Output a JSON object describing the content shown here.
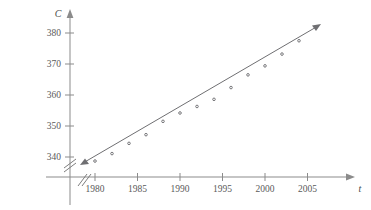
{
  "chart_data": {
    "type": "scatter",
    "title": "",
    "xlabel": "t",
    "ylabel": "C",
    "x_tick_labels": [
      "1980",
      "1985",
      "1990",
      "1995",
      "2000",
      "2005"
    ],
    "x_ticks": [
      1980,
      1985,
      1990,
      1995,
      2000,
      2005
    ],
    "y_tick_labels": [
      "340",
      "350",
      "360",
      "370",
      "380"
    ],
    "y_ticks": [
      340,
      350,
      360,
      370,
      380
    ],
    "xlim": [
      1978,
      2006.5
    ],
    "ylim": [
      336,
      383
    ],
    "grid": false,
    "legend": false,
    "axis_break_x": true,
    "axis_break_y": true,
    "x": [
      1980,
      1982,
      1984,
      1986,
      1988,
      1990,
      1992,
      1994,
      1996,
      1998,
      2000,
      2002,
      2004
    ],
    "y": [
      338.7,
      341.1,
      344.4,
      347.2,
      351.5,
      354.2,
      356.3,
      358.6,
      362.4,
      366.5,
      369.4,
      373.2,
      377.5
    ],
    "series": [
      {
        "name": "CO2 concentration",
        "marker": "small-circle",
        "values": [
          338.7,
          341.1,
          344.4,
          347.2,
          351.5,
          354.2,
          356.3,
          358.6,
          362.4,
          366.5,
          369.4,
          373.2,
          377.5
        ]
      }
    ],
    "fit_line": {
      "type": "linear-regression",
      "x_start": 1978.6,
      "y_start": 337.6,
      "x_end": 2006.3,
      "y_end": 381.6,
      "arrow_start": true,
      "arrow_end": true
    }
  },
  "axis": {
    "y_name": "C",
    "x_name": "t"
  },
  "colors": {
    "axis": "#8b8b8b",
    "line": "#6f6f72",
    "point": "#6a6a6d",
    "text": "#5a5a5a",
    "background": "#ffffff"
  }
}
